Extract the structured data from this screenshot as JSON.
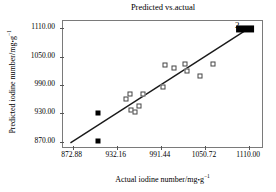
{
  "chart_data": {
    "type": "scatter",
    "title": "Predicted vs.actual",
    "xlabel": "Actual iodine number/mg·g⁻¹",
    "ylabel": "Predicted iodine number/mg·g⁻¹",
    "xlabel_parts": {
      "main": "Actual iodine number/mg",
      "dot": "•",
      "unit": "g",
      "exp": "−1"
    },
    "ylabel_parts": {
      "main": "Predicted iodine number/mg",
      "dot": "•",
      "unit": "g",
      "exp": "−1"
    },
    "xlim": [
      860.0,
      1130.0
    ],
    "ylim": [
      855.0,
      1125.0
    ],
    "xticks": [
      872.88,
      932.16,
      991.44,
      1050.72,
      1110.0
    ],
    "xticklabels": [
      "872.88",
      "932.16",
      "991.44",
      "1050.72",
      "1110.00"
    ],
    "yticks": [
      870.0,
      930.0,
      990.0,
      1050.0,
      1110.0
    ],
    "yticklabels": [
      "870.00",
      "930.00",
      "990.00",
      "1050.00",
      "1110.00"
    ],
    "grid": false,
    "legend": false,
    "annotations": [
      {
        "text": "2",
        "x": 1094.0,
        "y": 1117.0,
        "name": "point-count-label-2"
      }
    ],
    "fit_line": {
      "name": "identity-regression-line",
      "x0": 870.0,
      "y0": 868.0,
      "x1": 1110.0,
      "y1": 1110.0,
      "color": "#1a1a1a",
      "width": 1.4
    },
    "series": [
      {
        "name": "open-squares",
        "marker": "open-square",
        "color": "#444444",
        "points": [
          {
            "x": 945.0,
            "y": 961.0
          },
          {
            "x": 950.0,
            "y": 971.0
          },
          {
            "x": 951.5,
            "y": 937.0
          },
          {
            "x": 957.0,
            "y": 933.0
          },
          {
            "x": 962.0,
            "y": 945.0
          },
          {
            "x": 967.0,
            "y": 971.0
          },
          {
            "x": 994.0,
            "y": 986.0
          },
          {
            "x": 997.0,
            "y": 1033.0
          },
          {
            "x": 1009.0,
            "y": 1026.0
          },
          {
            "x": 1024.0,
            "y": 1034.0
          },
          {
            "x": 1026.0,
            "y": 1019.0
          },
          {
            "x": 1044.0,
            "y": 1010.0
          },
          {
            "x": 1061.0,
            "y": 1034.0
          }
        ]
      },
      {
        "name": "filled-squares-outliers",
        "marker": "filled-square",
        "color": "#000000",
        "points": [
          {
            "x": 907.0,
            "y": 930.0
          },
          {
            "x": 907.0,
            "y": 872.0
          }
        ]
      },
      {
        "name": "saturated-cluster",
        "marker": "filled-bar",
        "color": "#000000",
        "points": [
          {
            "x": 1104.0,
            "y": 1108.0,
            "width_units": 24.0,
            "height_units": 15.0
          }
        ]
      }
    ]
  }
}
